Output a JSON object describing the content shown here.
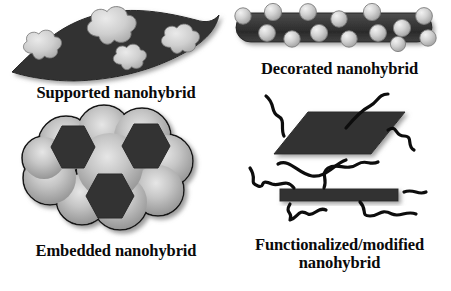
{
  "figure": {
    "background_color": "#ffffff",
    "width": 451,
    "height": 291
  },
  "palette": {
    "matrix_dark": "#333333",
    "matrix_dark_edge": "#1b1b1b",
    "particle_light": "#cccccc",
    "particle_light_edge": "#8f8f8f",
    "cloud_gray": "#b3b3b3",
    "outline_black": "#0d0d0d",
    "text_color": "#0a0a0a"
  },
  "panels": [
    {
      "id": "supported",
      "caption": "Supported nanohybrid",
      "description": "Curved dark support sheet with four light cloud-like nanoparticles resting on its surface",
      "support_shape": "wavy-sheet",
      "support_color": "#333333",
      "particle_color": "#cccccc",
      "particle_count": 4
    },
    {
      "id": "decorated",
      "caption": "Decorated nanohybrid",
      "description": "Dark rod / nanotube capsule decorated with light gray spheres along both edges",
      "rod_color": "#3a3a3a",
      "sphere_color": "#cfcfcf",
      "sphere_count": 14
    },
    {
      "id": "embedded",
      "caption": "Embedded nanohybrid",
      "description": "Gray cloud-like matrix with three dark hexagonal nanoparticles embedded inside",
      "matrix_color": "#b3b3b3",
      "hexagon_color": "#333333",
      "hexagon_count": 3
    },
    {
      "id": "functionalized",
      "caption": "Functionalized/modified\nnanohybrid",
      "description": "Dark 2D sheet (parallelogram) and a dark nanobar, both grafted with squiggly polymer chains",
      "sheet_color": "#333333",
      "bar_color": "#333333",
      "chain_color": "#0d0d0d",
      "chain_count": 9
    }
  ]
}
